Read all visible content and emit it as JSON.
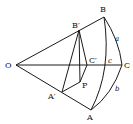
{
  "diagram": {
    "type": "spherical-triangle-construction",
    "points": {
      "O": {
        "label": "O"
      },
      "A": {
        "label": "A"
      },
      "B": {
        "label": "B"
      },
      "C": {
        "label": "C"
      },
      "A_prime": {
        "label": "A′"
      },
      "B_prime": {
        "label": "B′"
      },
      "C_prime": {
        "label": "C′"
      },
      "P": {
        "label": "P"
      }
    },
    "arcs": {
      "a": {
        "label": "a"
      },
      "b": {
        "label": "b"
      },
      "c": {
        "label": "c"
      }
    }
  }
}
